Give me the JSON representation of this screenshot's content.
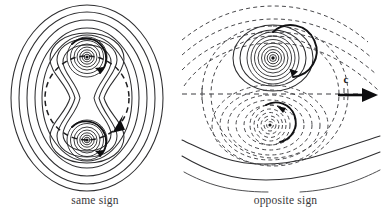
{
  "figure": {
    "background_color": "#ffffff",
    "stroke_color": "#2e2e30",
    "dashed_color": "#4a4a4d",
    "accent_color": "#0d0d0f",
    "width": 381,
    "height": 221
  },
  "panels": [
    {
      "id": "same-sign",
      "caption": "same sign",
      "description": "Co-rotating vortex pair: nested oval streamlines enclose both vortices, which orbit each other along a dashed circular path.",
      "vortices": [
        {
          "name": "upper-vortex",
          "center_x": 87,
          "center_y": 57,
          "spin": "counterclockwise",
          "sign": "positive",
          "core_rings": 7
        },
        {
          "name": "lower-vortex",
          "center_x": 87,
          "center_y": 140,
          "spin": "counterclockwise",
          "sign": "positive",
          "core_rings": 7
        }
      ],
      "orbit": {
        "name": "orbital-path",
        "style": "dashed",
        "center_x": 87,
        "center_y": 98,
        "radius": 42,
        "direction": "counterclockwise",
        "arrow_count": 1
      },
      "outer_contours": 5,
      "figure_eight_contours": 3
    },
    {
      "id": "opposite-sign",
      "caption": "opposite sign",
      "description": "Counter-rotating vortex pair translating to the right with self-induced speed c; closed dashed oval separates trapped fluid from the outer wavy streamlines.",
      "vortices": [
        {
          "name": "upper-vortex",
          "center_x": 83,
          "center_y": 58,
          "spin": "clockwise",
          "sign": "positive",
          "core_rings": 8,
          "streamline_style": "solid"
        },
        {
          "name": "lower-vortex",
          "center_x": 80,
          "center_y": 125,
          "spin": "clockwise",
          "sign": "negative",
          "core_rings": 8,
          "streamline_style": "dashed"
        }
      ],
      "symmetry_axis": {
        "name": "symmetry-axis",
        "style": "dashed",
        "y": 94
      },
      "translation": {
        "name": "translation-velocity",
        "label": "c",
        "direction": "right",
        "arrow_x_start": 148,
        "arrow_x_end": 185,
        "arrow_y": 95
      },
      "outer_contours": 6,
      "dashed_contours": 9
    }
  ]
}
